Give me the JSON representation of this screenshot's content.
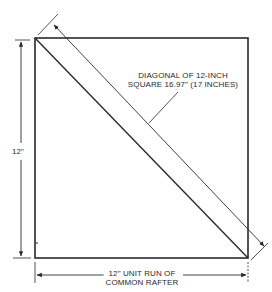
{
  "diagram": {
    "title": "",
    "labels": {
      "diagonal_line1": "DIAGONAL OF 12-INCH",
      "diagonal_line2": "SQUARE 16.97\" (17 INCHES)",
      "side": "12\"",
      "bottom_line1": "12\" UNIT RUN OF",
      "bottom_line2": "COMMON RAFTER"
    },
    "colors": {
      "line": "#2a2a2a",
      "background": "#ffffff"
    },
    "measurements": {
      "side_inches": 12,
      "run_inches": 12,
      "diagonal_inches": 16.97,
      "diagonal_rounded_inches": 17
    }
  }
}
